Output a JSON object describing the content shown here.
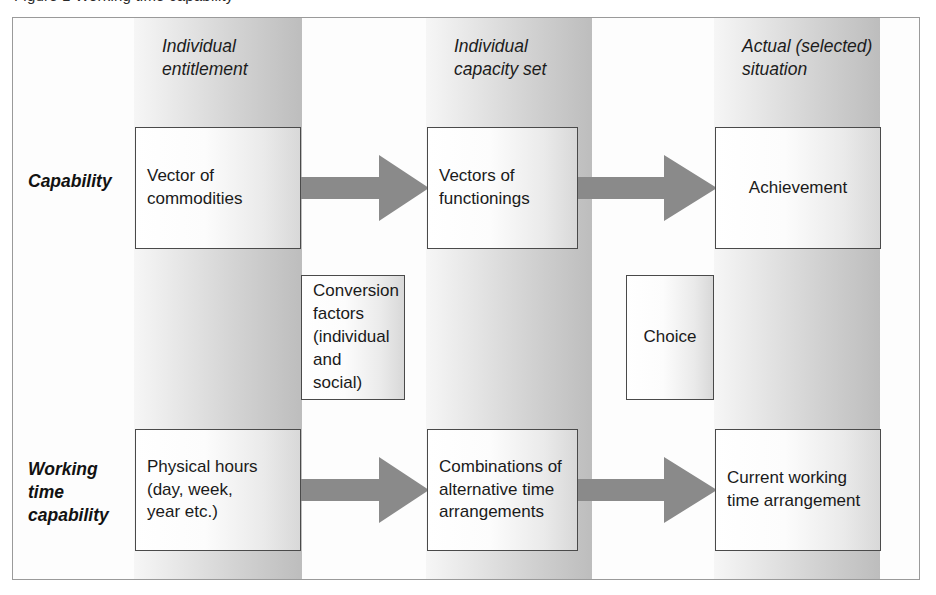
{
  "caption": {
    "text": "Figure 1  Working time capability"
  },
  "diagram": {
    "colors": {
      "arrow": "#8a8a8a",
      "band_light": "#f6f6f6",
      "band_dark": "#bdbdbd",
      "box_border": "#4a4a4a",
      "frame_border": "#9a9a9a",
      "text": "#1a1a1a"
    },
    "column_headers": [
      {
        "id": "entitlement",
        "label": "Individual\nentitlement"
      },
      {
        "id": "capacity",
        "label": "Individual\ncapacity set"
      },
      {
        "id": "actual",
        "label": "Actual (selected)\nsituation"
      }
    ],
    "row_labels": [
      {
        "id": "capability",
        "label": "Capability"
      },
      {
        "id": "working-time-capability",
        "label": "Working\ntime\ncapability"
      }
    ],
    "nodes": [
      {
        "id": "vector-commodities",
        "row": "capability",
        "column": "entitlement",
        "label": "Vector of\ncommodities"
      },
      {
        "id": "vectors-functionings",
        "row": "capability",
        "column": "capacity",
        "label": "Vectors of\nfunctionings"
      },
      {
        "id": "achievement",
        "row": "capability",
        "column": "actual",
        "label": "Achievement"
      },
      {
        "id": "conversion-factors",
        "row": "middle",
        "column": "between-entitlement-capacity",
        "label": "Conversion\nfactors\n(individual\nand social)"
      },
      {
        "id": "choice",
        "row": "middle",
        "column": "between-capacity-actual",
        "label": "Choice"
      },
      {
        "id": "physical-hours",
        "row": "working-time-capability",
        "column": "entitlement",
        "label": "Physical hours\n(day, week,\nyear etc.)"
      },
      {
        "id": "combinations-alternative-time",
        "row": "working-time-capability",
        "column": "capacity",
        "label": "Combinations of\nalternative time\narrangements"
      },
      {
        "id": "current-working-time",
        "row": "working-time-capability",
        "column": "actual",
        "label": "Current working\ntime arrangement"
      }
    ],
    "arrows": [
      {
        "id": "arrow-capability-1",
        "from": "vector-commodities",
        "to": "vectors-functionings",
        "direction": "right"
      },
      {
        "id": "arrow-capability-2",
        "from": "vectors-functionings",
        "to": "achievement",
        "direction": "right"
      },
      {
        "id": "arrow-working-1",
        "from": "physical-hours",
        "to": "combinations-alternative-time",
        "direction": "right"
      },
      {
        "id": "arrow-working-2",
        "from": "combinations-alternative-time",
        "to": "current-working-time",
        "direction": "right"
      }
    ]
  }
}
